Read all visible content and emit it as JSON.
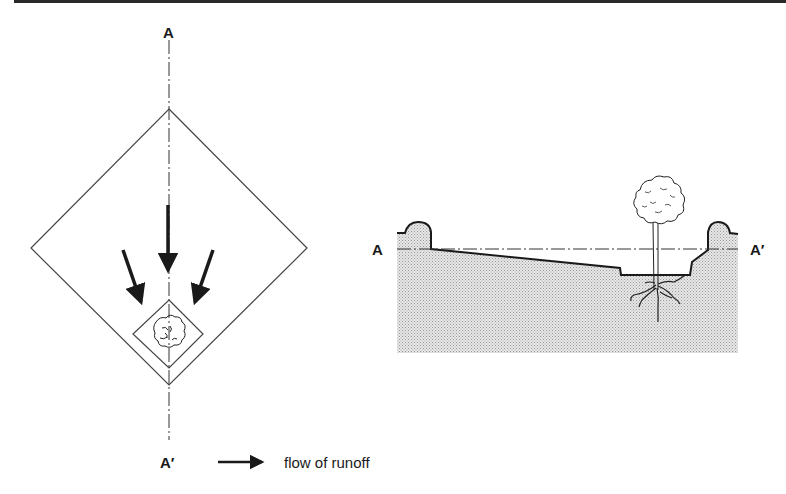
{
  "plan_view": {
    "section_label_top": "A",
    "section_label_bottom": "A′",
    "outer_area": "drainage-area-diamond",
    "inner_area": "tree-planting-basin",
    "arrows": [
      "left-arrow",
      "center-arrow",
      "right-arrow"
    ]
  },
  "section_view": {
    "label_left": "A",
    "label_right": "A′",
    "elements": [
      "left-berm",
      "sloped-grade",
      "planting-depression",
      "right-berm",
      "tree",
      "roots",
      "soil-stipple"
    ]
  },
  "legend": {
    "arrow_icon": "arrow-right-icon",
    "text": "flow of runoff"
  },
  "colors": {
    "line": "#1a1a1a",
    "soil": "#d4d4d4",
    "topbar": "#2a2a2a"
  }
}
